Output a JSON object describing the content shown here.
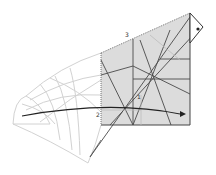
{
  "diagram": {
    "labels": [
      {
        "id": "label-3",
        "text": "3",
        "x": 125,
        "y": 37
      },
      {
        "id": "label-1",
        "text": "1",
        "x": 137,
        "y": 99
      },
      {
        "id": "label-2",
        "text": "2",
        "x": 96,
        "y": 117
      }
    ],
    "colors": {
      "square_fill": "#dcdcdc",
      "line_dark": "#3a3a3a",
      "line_faint": "#cfcfcf",
      "arrow": "#222222"
    }
  }
}
